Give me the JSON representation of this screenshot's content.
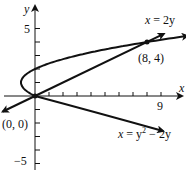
{
  "chart_data": {
    "type": "line",
    "title": "",
    "xlabel": "x",
    "ylabel": "y",
    "xlim": [
      -2.5,
      10.5
    ],
    "ylim": [
      -5.5,
      6.5
    ],
    "grid": false,
    "x_ticks": [
      1,
      2,
      3,
      4,
      5,
      6,
      7,
      8,
      9
    ],
    "x_tick_labels_shown": [
      "9"
    ],
    "y_ticks": [
      -5,
      -4,
      -3,
      -2,
      -1,
      1,
      2,
      3,
      4,
      5
    ],
    "y_tick_labels_shown": [
      "5",
      "-5"
    ],
    "series": [
      {
        "name": "x = 2y",
        "kind": "line",
        "equation": "x = 2y",
        "points": [
          [
            -2.3,
            -1.15
          ],
          [
            0,
            0
          ],
          [
            8,
            4
          ],
          [
            9.2,
            4.6
          ]
        ]
      },
      {
        "name": "x = y^2 - 2y",
        "kind": "parabola",
        "equation": "x = y^2 - 2y",
        "y_range": [
          -0.7,
          4.6
        ],
        "points": [
          [
            1.89,
            -0.7
          ],
          [
            0,
            0
          ],
          [
            -0.75,
            0.5
          ],
          [
            -1,
            1
          ],
          [
            -0.75,
            1.5
          ],
          [
            0,
            2
          ],
          [
            1.25,
            2.5
          ],
          [
            3,
            3
          ],
          [
            5.25,
            3.5
          ],
          [
            8,
            4
          ],
          [
            11.96,
            4.6
          ]
        ]
      }
    ],
    "annotations": [
      {
        "text": "x = 2y",
        "at": [
          9.0,
          5.3
        ]
      },
      {
        "text": "(8, 4)",
        "at": [
          8.0,
          3.0
        ],
        "point": [
          8,
          4
        ]
      },
      {
        "text": "(0, 0)",
        "at": [
          -1.5,
          -2.3
        ],
        "point": [
          0,
          0
        ]
      },
      {
        "text": "x = y² − 2y",
        "at": [
          8.5,
          -2.4
        ]
      }
    ]
  },
  "labels": {
    "x_axis": "x",
    "y_axis": "y",
    "tick_9": "9",
    "tick_5": "5",
    "tick_neg5": "−5",
    "line_eq_lhs": "x",
    "line_eq_rhs": " = 2y",
    "point_intersection": "(8, 4)",
    "point_origin": "(0, 0)",
    "parabola_eq_x": "x",
    "parabola_eq_mid": " = y",
    "parabola_eq_sup": "2",
    "parabola_eq_tail": " − 2y"
  }
}
